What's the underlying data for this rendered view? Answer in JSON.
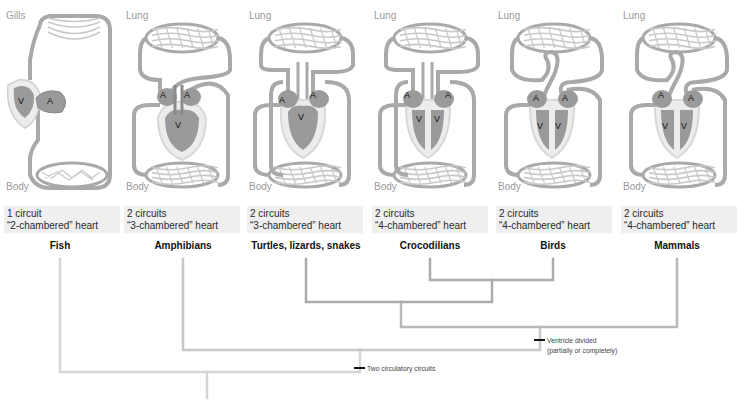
{
  "panels": [
    {
      "top_organ": "Gills",
      "bottom_organ": "Body",
      "circuits": "1 circuit",
      "heart": "“2-chambered” heart",
      "taxon": "Fish",
      "chambers": [
        {
          "label": "V",
          "x": 21,
          "y": 104
        },
        {
          "label": "A",
          "x": 50,
          "y": 104
        }
      ]
    },
    {
      "top_organ": "Lung",
      "bottom_organ": "Body",
      "circuits": "2 circuits",
      "heart": "“3-chambered” heart",
      "taxon": "Amphibians",
      "chambers": [
        {
          "label": "A",
          "x": 43,
          "y": 98
        },
        {
          "label": "A",
          "x": 67,
          "y": 98
        },
        {
          "label": "V",
          "x": 58,
          "y": 128
        }
      ]
    },
    {
      "top_organ": "Lung",
      "bottom_organ": "Body",
      "circuits": "2 circuits",
      "heart": "“3-chambered” heart",
      "taxon": "Turtles, lizards, snakes",
      "chambers": [
        {
          "label": "A",
          "x": 39,
          "y": 103
        },
        {
          "label": "A",
          "x": 70,
          "y": 98
        },
        {
          "label": "V",
          "x": 58,
          "y": 120
        }
      ]
    },
    {
      "top_organ": "Lung",
      "bottom_organ": "Body",
      "circuits": "2 circuits",
      "heart": "“4-chambered” heart",
      "taxon": "Crocodilians",
      "chambers": [
        {
          "label": "A",
          "x": 39,
          "y": 98
        },
        {
          "label": "A",
          "x": 80,
          "y": 98
        },
        {
          "label": "V",
          "x": 51,
          "y": 122
        },
        {
          "label": "V",
          "x": 69,
          "y": 122
        }
      ]
    },
    {
      "top_organ": "Lung",
      "bottom_organ": "Body",
      "circuits": "2 circuits",
      "heart": "“4-chambered” heart",
      "taxon": "Birds",
      "chambers": [
        {
          "label": "A",
          "x": 44,
          "y": 101
        },
        {
          "label": "A",
          "x": 73,
          "y": 101
        },
        {
          "label": "V",
          "x": 48,
          "y": 129
        },
        {
          "label": "V",
          "x": 66,
          "y": 129
        }
      ]
    },
    {
      "top_organ": "Lung",
      "bottom_organ": "Body",
      "circuits": "2 circuits",
      "heart": "“4-chambered” heart",
      "taxon": "Mammals",
      "chambers": [
        {
          "label": "A",
          "x": 44,
          "y": 98
        },
        {
          "label": "A",
          "x": 74,
          "y": 101
        },
        {
          "label": "V",
          "x": 48,
          "y": 129
        },
        {
          "label": "V",
          "x": 67,
          "y": 129
        }
      ]
    }
  ],
  "cladogram": {
    "characters": [
      {
        "label_line1": "Two circulatory circuits",
        "label_line2": ""
      },
      {
        "label_line1": "Ventricle divided",
        "label_line2": "(partially or completely)"
      }
    ],
    "colors": {
      "outer": "#d5d5d5",
      "middle": "#c4c4c4",
      "inner": "#b0b0b0",
      "tick": "#111111"
    }
  }
}
